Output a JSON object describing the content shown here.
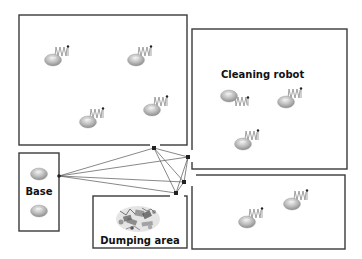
{
  "diagram": {
    "title": "",
    "zones": [
      {
        "id": "zone-top-left",
        "x": 19,
        "y": 15,
        "w": 168,
        "h": 130,
        "label": ""
      },
      {
        "id": "zone-right",
        "x": 192,
        "y": 29,
        "w": 155,
        "h": 140,
        "label": "Cleaning robot"
      },
      {
        "id": "zone-bottom-right",
        "x": 192,
        "y": 175,
        "w": 153,
        "h": 74,
        "label": ""
      },
      {
        "id": "zone-base",
        "x": 19,
        "y": 153,
        "w": 40,
        "h": 78,
        "label": "Base"
      },
      {
        "id": "zone-dumping",
        "x": 93,
        "y": 196,
        "w": 94,
        "h": 52,
        "label": "Dumping area"
      }
    ],
    "labels": {
      "cleaning_robot": "Cleaning robot",
      "base": "Base",
      "dumping_area": "Dumping area"
    },
    "robots": [
      {
        "zone": "zone-top-left",
        "x": 53,
        "y": 58,
        "moving": true
      },
      {
        "zone": "zone-top-left",
        "x": 136,
        "y": 58,
        "moving": true
      },
      {
        "zone": "zone-top-left",
        "x": 88,
        "y": 121,
        "moving": true
      },
      {
        "zone": "zone-top-left",
        "x": 152,
        "y": 108,
        "moving": true
      },
      {
        "zone": "zone-right",
        "x": 231,
        "y": 96,
        "moving": true,
        "spring_side": "below"
      },
      {
        "zone": "zone-right",
        "x": 289,
        "y": 103,
        "moving": true
      },
      {
        "zone": "zone-right",
        "x": 243,
        "y": 144,
        "moving": true
      },
      {
        "zone": "zone-bottom-right",
        "x": 247,
        "y": 222,
        "moving": true
      },
      {
        "zone": "zone-bottom-right",
        "x": 292,
        "y": 203,
        "moving": true
      },
      {
        "zone": "zone-base",
        "x": 39,
        "y": 174,
        "moving": false
      },
      {
        "zone": "zone-base",
        "x": 39,
        "y": 210,
        "moving": false
      }
    ],
    "hubs": [
      {
        "id": "hub-base",
        "x": 59,
        "y": 176
      },
      {
        "id": "hub-top",
        "x": 154,
        "y": 148
      },
      {
        "id": "hub-right-top",
        "x": 188,
        "y": 157
      },
      {
        "id": "hub-right-mid",
        "x": 184,
        "y": 182
      },
      {
        "id": "hub-bottom",
        "x": 176,
        "y": 193
      }
    ],
    "links": [
      [
        "hub-base",
        "hub-top"
      ],
      [
        "hub-base",
        "hub-right-top"
      ],
      [
        "hub-base",
        "hub-right-mid"
      ],
      [
        "hub-base",
        "hub-bottom"
      ],
      [
        "hub-top",
        "hub-right-top"
      ],
      [
        "hub-top",
        "hub-right-mid"
      ],
      [
        "hub-top",
        "hub-bottom"
      ],
      [
        "hub-right-top",
        "hub-right-mid"
      ],
      [
        "hub-right-top",
        "hub-bottom"
      ],
      [
        "hub-right-mid",
        "hub-bottom"
      ]
    ],
    "colors": {
      "border": "#3a3a3a",
      "robot_fill": "#b8b8b8",
      "robot_highlight": "#e6e6e6",
      "link": "#555555",
      "text": "#111111"
    }
  }
}
